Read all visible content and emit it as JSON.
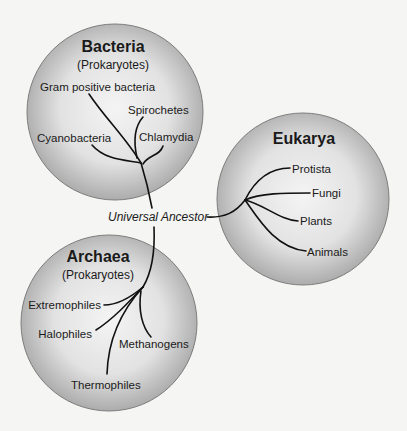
{
  "diagram": {
    "type": "phylogenetic-tree",
    "root": {
      "label": "Universal Ancestor"
    },
    "domains": [
      {
        "name": "Bacteria",
        "subtitle": "(Prokaryotes)",
        "groups": [
          "Gram positive bacteria",
          "Spirochetes",
          "Cyanobacteria",
          "Chlamydia"
        ]
      },
      {
        "name": "Eukarya",
        "subtitle": "",
        "groups": [
          "Protista",
          "Fungi",
          "Plants",
          "Animals"
        ]
      },
      {
        "name": "Archaea",
        "subtitle": "(Prokaryotes)",
        "groups": [
          "Extremophiles",
          "Halophiles",
          "Methanogens",
          "Thermophiles"
        ]
      }
    ]
  },
  "colors": {
    "background": "#f5f5f3",
    "circle_center": "#f2f2f2",
    "circle_edge": "#b3b3b3",
    "line": "#111111"
  }
}
